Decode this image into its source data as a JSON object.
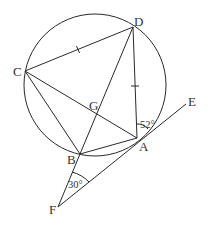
{
  "diagram": {
    "type": "circle-geometry",
    "circle": {
      "cx": 95,
      "cy": 85,
      "r": 71
    },
    "points": {
      "A": {
        "label": "A",
        "x": 137,
        "y": 138
      },
      "B": {
        "label": "B",
        "x": 80,
        "y": 154
      },
      "C": {
        "label": "C",
        "x": 25,
        "y": 71
      },
      "D": {
        "label": "D",
        "x": 133,
        "y": 27
      },
      "E": {
        "label": "E",
        "x": 186,
        "y": 104
      },
      "F": {
        "label": "F",
        "x": 58,
        "y": 207
      },
      "G": {
        "label": "G",
        "x": 97,
        "y": 118
      }
    },
    "segments": [
      "CD",
      "DA",
      "DB",
      "CA",
      "CB",
      "BA",
      "FE",
      "FB"
    ],
    "tick_marks": [
      "CD",
      "DA"
    ],
    "angles": {
      "at_A": {
        "label": "52°"
      },
      "at_F": {
        "label": "30°"
      }
    }
  }
}
